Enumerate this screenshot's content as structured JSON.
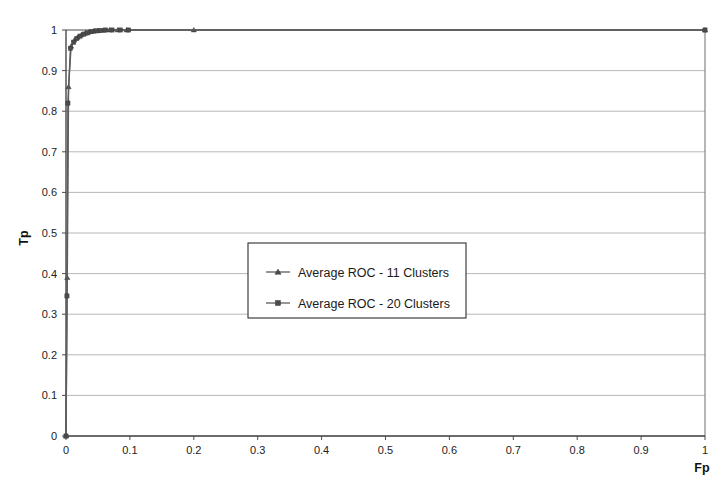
{
  "chart_data": {
    "type": "line",
    "title": "",
    "xlabel": "Fp",
    "ylabel": "Tp",
    "xlim": [
      0,
      1
    ],
    "ylim": [
      0,
      1
    ],
    "grid": "horizontal",
    "legend_position": "center",
    "x_ticks": [
      "0",
      "0.1",
      "0.2",
      "0.3",
      "0.4",
      "0.5",
      "0.6",
      "0.7",
      "0.8",
      "0.9",
      "1"
    ],
    "y_ticks": [
      "0",
      "0.1",
      "0.2",
      "0.3",
      "0.4",
      "0.5",
      "0.6",
      "0.7",
      "0.8",
      "0.9",
      "1"
    ],
    "series": [
      {
        "name": "Average ROC - 11 Clusters",
        "marker": "triangle",
        "x": [
          0,
          0.002,
          0.004,
          0.008,
          0.013,
          0.018,
          0.024,
          0.03,
          0.036,
          0.043,
          0.05,
          0.058,
          0.068,
          0.081,
          0.095,
          0.2,
          1
        ],
        "y": [
          0,
          0.39,
          0.86,
          0.96,
          0.975,
          0.982,
          0.988,
          0.992,
          0.995,
          0.997,
          0.998,
          0.999,
          1,
          1,
          1,
          1,
          1
        ]
      },
      {
        "name": "Average ROC - 20 Clusters",
        "marker": "square",
        "x": [
          0,
          0.0015,
          0.003,
          0.007,
          0.012,
          0.017,
          0.022,
          0.028,
          0.034,
          0.04,
          0.047,
          0.054,
          0.062,
          0.072,
          0.085,
          0.098,
          1
        ],
        "y": [
          0,
          0.345,
          0.82,
          0.955,
          0.97,
          0.979,
          0.985,
          0.99,
          0.993,
          0.996,
          0.998,
          0.999,
          1,
          1,
          1,
          1,
          1
        ]
      }
    ]
  },
  "legend": {
    "entries": [
      {
        "label": "Average ROC - 11 Clusters",
        "marker": "triangle"
      },
      {
        "label": "Average ROC - 20 Clusters",
        "marker": "square"
      }
    ]
  },
  "colors": {
    "series_line": "#5d5d5d",
    "marker": "#4b4b4b",
    "grid": "#9a9a9a",
    "axis": "#3a3a3a",
    "background": "#ffffff"
  }
}
